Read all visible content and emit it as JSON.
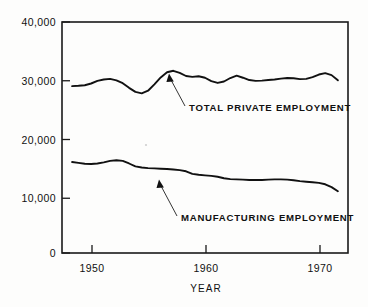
{
  "chart_data": {
    "type": "line",
    "title": "",
    "xlabel": "YEAR",
    "ylabel": "",
    "xlim": [
      1948.2,
      1970.8
    ],
    "ylim": [
      0,
      40000
    ],
    "grid": false,
    "legend_position": "inline-annotations",
    "xticks": [
      1950,
      1960,
      1970
    ],
    "xtick_labels": [
      "1950",
      "1960",
      "1970"
    ],
    "yticks": [
      0,
      10000,
      20000,
      30000,
      40000
    ],
    "ytick_labels": [
      "0",
      "10,000",
      "20,000",
      "30,000",
      "40,000"
    ],
    "x": [
      1949.0,
      1949.5,
      1950.0,
      1950.5,
      1951.0,
      1951.5,
      1952.0,
      1952.5,
      1953.0,
      1953.5,
      1954.0,
      1954.5,
      1955.0,
      1955.5,
      1956.0,
      1956.5,
      1957.0,
      1957.5,
      1958.0,
      1958.5,
      1959.0,
      1959.5,
      1960.0,
      1960.5,
      1961.0,
      1961.5,
      1962.0,
      1962.5,
      1963.0,
      1963.5,
      1964.0,
      1964.5,
      1965.0,
      1965.5,
      1966.0,
      1966.5,
      1967.0,
      1967.5,
      1968.0,
      1968.5,
      1969.0,
      1969.5,
      1970.0
    ],
    "series": [
      {
        "name": "TOTAL PRIVATE EMPLOYMENT",
        "annotation": "TOTAL  PRIVATE  EMPLOYMENT",
        "values": [
          28900,
          28950,
          29050,
          29350,
          29800,
          30050,
          30150,
          29900,
          29400,
          28600,
          27900,
          27650,
          28100,
          29200,
          30400,
          31300,
          31550,
          31200,
          30650,
          30500,
          30600,
          30350,
          29750,
          29450,
          29700,
          30300,
          30700,
          30350,
          29950,
          29800,
          29850,
          29950,
          30050,
          30200,
          30300,
          30250,
          30100,
          30150,
          30450,
          30900,
          31150,
          30800,
          29900
        ]
      },
      {
        "name": "MANUFACTURING EMPLOYMENT",
        "annotation": "MANUFACTURING  EMPLOYMENT",
        "values": [
          15750,
          15600,
          15450,
          15400,
          15500,
          15700,
          15950,
          16050,
          15950,
          15500,
          15000,
          14800,
          14700,
          14650,
          14600,
          14550,
          14450,
          14350,
          14150,
          13700,
          13550,
          13450,
          13350,
          13200,
          12950,
          12800,
          12750,
          12700,
          12650,
          12650,
          12650,
          12700,
          12750,
          12750,
          12700,
          12600,
          12450,
          12350,
          12250,
          12150,
          11900,
          11400,
          10700
        ]
      }
    ],
    "annotations": [
      {
        "text": "TOTAL  PRIVATE  EMPLOYMENT",
        "points_to_year": 1956.4,
        "points_to_value": 31450
      },
      {
        "text": "MANUFACTURING  EMPLOYMENT",
        "points_to_year": 1955.6,
        "points_to_value": 14640
      }
    ]
  },
  "colors": {
    "background": "#fdfdfc",
    "line": "#111111",
    "axis": "#1a1a1a",
    "text": "#111111"
  }
}
